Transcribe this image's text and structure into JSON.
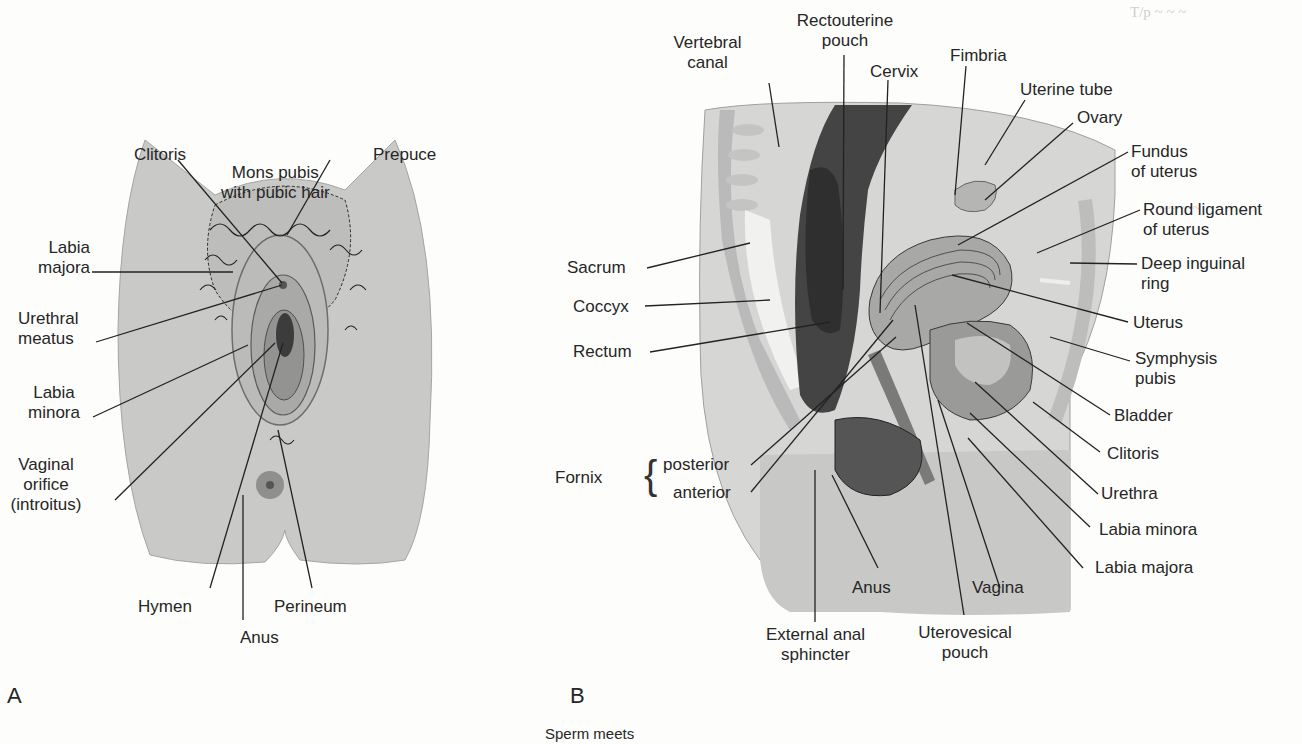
{
  "figure": {
    "panel_a": {
      "letter": "A",
      "labels": [
        {
          "id": "clitoris",
          "text": "Clitoris"
        },
        {
          "id": "mons_pubis",
          "text": "Mons pubis\nwith pubic hair"
        },
        {
          "id": "prepuce",
          "text": "Prepuce"
        },
        {
          "id": "labia_majora",
          "text": "Labia\nmajora"
        },
        {
          "id": "urethral_meatus",
          "text": "Urethral\nmeatus"
        },
        {
          "id": "labia_minora",
          "text": "Labia\nminora"
        },
        {
          "id": "vaginal_orifice",
          "text": "Vaginal\norifice\n(introitus)"
        },
        {
          "id": "hymen",
          "text": "Hymen"
        },
        {
          "id": "anus",
          "text": "Anus"
        },
        {
          "id": "perineum",
          "text": "Perineum"
        }
      ]
    },
    "panel_b": {
      "letter": "B",
      "labels": [
        {
          "id": "vertebral_canal",
          "text": "Vertebral\ncanal"
        },
        {
          "id": "rectouterine_pouch",
          "text": "Rectouterine\npouch"
        },
        {
          "id": "cervix",
          "text": "Cervix"
        },
        {
          "id": "fimbria",
          "text": "Fimbria"
        },
        {
          "id": "uterine_tube",
          "text": "Uterine tube"
        },
        {
          "id": "ovary",
          "text": "Ovary"
        },
        {
          "id": "fundus",
          "text": "Fundus\nof uterus"
        },
        {
          "id": "round_ligament",
          "text": "Round ligament\nof uterus"
        },
        {
          "id": "deep_inguinal_ring",
          "text": "Deep inguinal\nring"
        },
        {
          "id": "uterus",
          "text": "Uterus"
        },
        {
          "id": "symphysis_pubis",
          "text": "Symphysis\npubis"
        },
        {
          "id": "bladder",
          "text": "Bladder"
        },
        {
          "id": "clitoris",
          "text": "Clitoris"
        },
        {
          "id": "urethra",
          "text": "Urethra"
        },
        {
          "id": "labia_minora",
          "text": "Labia minora"
        },
        {
          "id": "labia_majora",
          "text": "Labia majora"
        },
        {
          "id": "vagina",
          "text": "Vagina"
        },
        {
          "id": "uterovesical_pouch",
          "text": "Uterovesical\npouch"
        },
        {
          "id": "external_anal_sphincter",
          "text": "External anal\nsphincter"
        },
        {
          "id": "anus",
          "text": "Anus"
        },
        {
          "id": "sacrum",
          "text": "Sacrum"
        },
        {
          "id": "coccyx",
          "text": "Coccyx"
        },
        {
          "id": "rectum",
          "text": "Rectum"
        }
      ],
      "fornix": {
        "title": "Fornix",
        "posterior": "posterior",
        "anterior": "anterior"
      }
    },
    "footer_fragment": "Sperm meets"
  }
}
